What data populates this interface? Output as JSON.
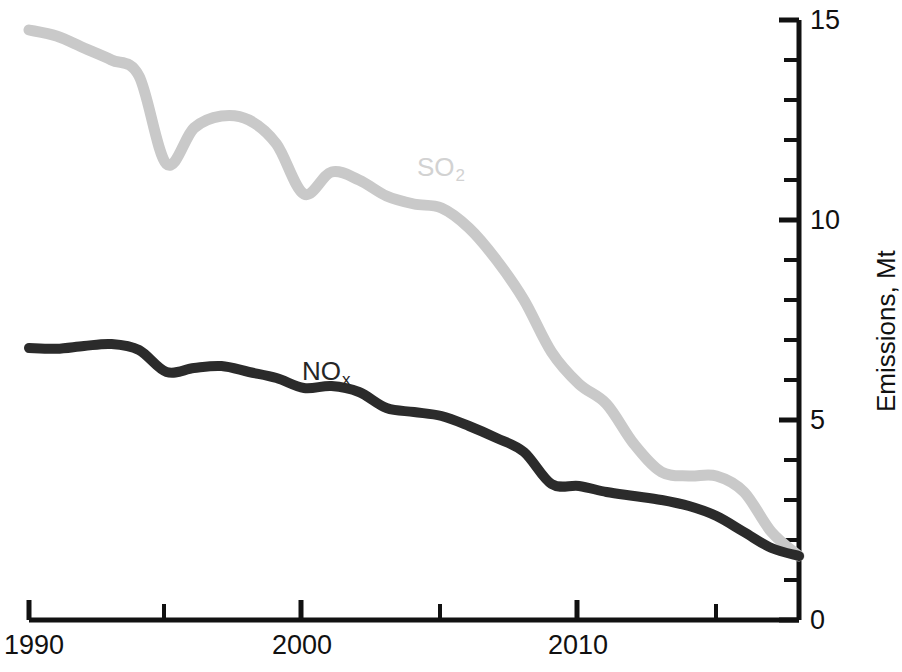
{
  "chart_data": {
    "type": "line",
    "title": "",
    "subtitle": "",
    "xlabel": "",
    "ylabel": "Emissions, Mt",
    "xlim": [
      1990,
      2018
    ],
    "ylim": [
      0,
      15
    ],
    "grid": false,
    "legend": "inline-labels",
    "x_major_ticks": [
      1990,
      2000,
      2010
    ],
    "x_minor_ticks": [
      1995,
      2005,
      2015
    ],
    "x_tick_labels": [
      "1990",
      "2000",
      "2010"
    ],
    "y_major_ticks": [
      0,
      5,
      10,
      15
    ],
    "y_minor_ticks": [
      1,
      2,
      3,
      4,
      6,
      7,
      8,
      9,
      11,
      12,
      13,
      14
    ],
    "y_tick_labels": [
      "0",
      "5",
      "10",
      "15"
    ],
    "y_axis_position": "right",
    "x": [
      1990,
      1991,
      1992,
      1993,
      1994,
      1995,
      1996,
      1997,
      1998,
      1999,
      2000,
      2001,
      2002,
      2003,
      2004,
      2005,
      2006,
      2007,
      2008,
      2009,
      2010,
      2011,
      2012,
      2013,
      2014,
      2015,
      2016,
      2017,
      2018
    ],
    "series": [
      {
        "name": "SO2",
        "label": "SO",
        "label_sub": "2",
        "color": "#c9c9c9",
        "values": [
          14.75,
          14.6,
          14.3,
          14.0,
          13.6,
          11.4,
          12.3,
          12.6,
          12.5,
          11.9,
          10.65,
          11.2,
          11.0,
          10.6,
          10.4,
          10.3,
          9.8,
          9.0,
          8.0,
          6.7,
          5.9,
          5.4,
          4.4,
          3.7,
          3.6,
          3.6,
          3.2,
          2.2,
          1.6
        ]
      },
      {
        "name": "NOx",
        "label": "NO",
        "label_sub": "x",
        "color": "#2b2b2b",
        "values": [
          6.8,
          6.78,
          6.85,
          6.9,
          6.75,
          6.2,
          6.3,
          6.35,
          6.2,
          6.05,
          5.8,
          5.85,
          5.7,
          5.3,
          5.2,
          5.1,
          4.85,
          4.55,
          4.2,
          3.4,
          3.35,
          3.2,
          3.1,
          3.0,
          2.85,
          2.6,
          2.2,
          1.8,
          1.6
        ]
      }
    ]
  },
  "axis": {
    "y_title": "Emissions, Mt"
  },
  "ticks": {
    "x": [
      {
        "label": "1990",
        "px": 29
      },
      {
        "label": "2000",
        "px": 301
      },
      {
        "label": "2010",
        "px": 577
      }
    ],
    "y": [
      {
        "label": "15",
        "py": 20
      },
      {
        "label": "10",
        "py": 220
      },
      {
        "label": "5",
        "py": 420
      },
      {
        "label": "0",
        "py": 620
      }
    ]
  },
  "series_labels": {
    "so2": {
      "text": "SO",
      "sub": "2"
    },
    "nox": {
      "text": "NO",
      "sub": "x"
    }
  }
}
